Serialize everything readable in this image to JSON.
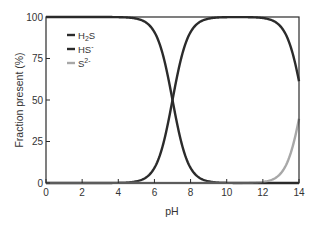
{
  "chart_data": {
    "type": "line",
    "title": "",
    "xlabel": "pH",
    "ylabel": "Fraction present (%)",
    "xlim": [
      0,
      14
    ],
    "ylim": [
      0,
      100
    ],
    "xticks": [
      0,
      2,
      4,
      6,
      8,
      10,
      12,
      14
    ],
    "yticks": [
      0,
      25,
      50,
      75,
      100
    ],
    "grid": false,
    "legend_position": "upper-left inside",
    "x": [
      0,
      1,
      2,
      3,
      4,
      5,
      6,
      6.5,
      7,
      7.5,
      8,
      9,
      10,
      11,
      12,
      12.5,
      13,
      13.5,
      14
    ],
    "series": [
      {
        "name": "H2S",
        "label_main": "H",
        "label_sub": "2",
        "label_tail": "S",
        "color": "#2b2b2b",
        "values": [
          100,
          100,
          100,
          99.9,
          99.9,
          99.0,
          90.9,
          76.0,
          50.0,
          24.0,
          9.1,
          1.0,
          0.1,
          0.0,
          0.0,
          0.0,
          0.0,
          0.0,
          0.0
        ]
      },
      {
        "name": "HS-",
        "label_main": "HS",
        "label_sup": "-",
        "color": "#2b2b2b",
        "values": [
          0,
          0,
          0,
          0.1,
          0.1,
          1.0,
          9.1,
          24.0,
          50.0,
          76.0,
          90.9,
          99.0,
          99.8,
          99.4,
          98.4,
          95.2,
          86.3,
          66.7,
          61.3
        ]
      },
      {
        "name": "S2-",
        "label_main": "S",
        "label_sup": "2-",
        "color": "#a8a8a8",
        "values": [
          0,
          0,
          0,
          0,
          0,
          0,
          0,
          0,
          0,
          0,
          0,
          0,
          0.2,
          0.6,
          1.6,
          4.8,
          13.7,
          33.3,
          38.7
        ]
      }
    ],
    "model": {
      "pKa1": 7.0,
      "pKa2": 14.2
    }
  }
}
